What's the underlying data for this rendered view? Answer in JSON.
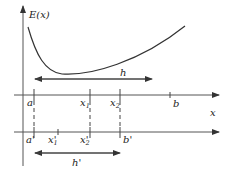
{
  "diagram": {
    "y_axis_label": "E(x)",
    "x_axis_label": "x",
    "top_axis": {
      "points": [
        {
          "label": "a",
          "x": 34
        },
        {
          "label": "x",
          "sub": "1",
          "x": 90
        },
        {
          "label": "x",
          "sub": "2",
          "x": 120
        },
        {
          "label": "b",
          "x": 170
        }
      ],
      "interval_label": "h"
    },
    "bottom_axis": {
      "points": [
        {
          "label": "a'",
          "x": 34
        },
        {
          "label": "x'",
          "sub": "1",
          "x": 58
        },
        {
          "label": "x'",
          "sub": "2",
          "x": 90
        },
        {
          "label": "b'",
          "x": 120
        }
      ],
      "interval_label": "h'"
    },
    "colors": {
      "line": "#444444",
      "curve": "#333333",
      "background": "#ffffff"
    }
  }
}
